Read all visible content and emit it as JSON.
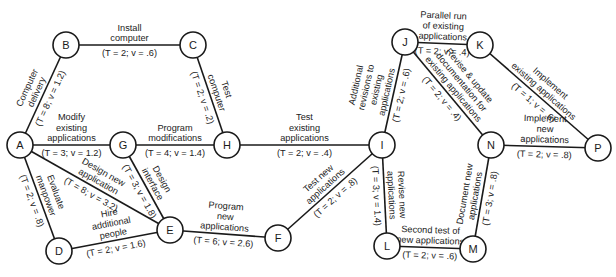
{
  "diagram": {
    "type": "PERT network",
    "nodes": [
      {
        "id": "A",
        "x": 20,
        "y": 145
      },
      {
        "id": "B",
        "x": 66,
        "y": 45
      },
      {
        "id": "C",
        "x": 193,
        "y": 45
      },
      {
        "id": "G",
        "x": 123,
        "y": 145
      },
      {
        "id": "H",
        "x": 227,
        "y": 145
      },
      {
        "id": "I",
        "x": 382,
        "y": 145
      },
      {
        "id": "J",
        "x": 405,
        "y": 42
      },
      {
        "id": "K",
        "x": 480,
        "y": 45
      },
      {
        "id": "N",
        "x": 491,
        "y": 145
      },
      {
        "id": "P",
        "x": 598,
        "y": 148
      },
      {
        "id": "D",
        "x": 59,
        "y": 251
      },
      {
        "id": "E",
        "x": 170,
        "y": 230
      },
      {
        "id": "F",
        "x": 278,
        "y": 238
      },
      {
        "id": "L",
        "x": 387,
        "y": 246
      },
      {
        "id": "M",
        "x": 473,
        "y": 249
      }
    ],
    "edges": [
      {
        "from": "A",
        "to": "B",
        "activity": "Computer delivery",
        "T": "8",
        "v": "1.2",
        "label_lines": [
          "Computer",
          "delivery"
        ],
        "param": "(T = 8; v = 1.2)"
      },
      {
        "from": "B",
        "to": "C",
        "activity": "Install computer",
        "T": "2",
        "v": ".6",
        "label_lines": [
          "Install",
          "computer"
        ],
        "param": "(T = 2; v = .6)"
      },
      {
        "from": "C",
        "to": "H",
        "activity": "Test computer",
        "T": "2",
        "v": ".2",
        "label_lines": [
          "Test",
          "computer"
        ],
        "param": "(T = 2; v = .2)"
      },
      {
        "from": "A",
        "to": "G",
        "activity": "Modify existing applications",
        "T": "3",
        "v": "1.2",
        "label_lines": [
          "Modify",
          "existing",
          "applications"
        ],
        "param": "(T = 3; v = 1.2)"
      },
      {
        "from": "G",
        "to": "H",
        "activity": "Program modifications",
        "T": "4",
        "v": "1.4",
        "label_lines": [
          "Program",
          "modifications"
        ],
        "param": "(T = 4; v = 1.4)"
      },
      {
        "from": "H",
        "to": "I",
        "activity": "Test existing applications",
        "T": "2",
        "v": ".4",
        "label_lines": [
          "Test",
          "existing",
          "applications"
        ],
        "param": "(T = 2; v = .4)"
      },
      {
        "from": "A",
        "to": "D",
        "activity": "Evaluate manpower",
        "T": "2",
        "v": ".8",
        "label_lines": [
          "Evaluate",
          "manpower"
        ],
        "param": "(T = 2; v = .8)"
      },
      {
        "from": "A",
        "to": "E",
        "activity": "Design new application",
        "T": "8",
        "v": "3.2",
        "label_lines": [
          "Design new",
          "application"
        ],
        "param": "(T = 8; v = 3.2)"
      },
      {
        "from": "G",
        "to": "E",
        "activity": "Design interface",
        "T": "3",
        "v": "1.8",
        "label_lines": [
          "Design",
          "interface"
        ],
        "param": "(T = 3; v = 1.8)"
      },
      {
        "from": "D",
        "to": "E",
        "activity": "Hire additional people",
        "T": "2",
        "v": "1.6",
        "label_lines": [
          "Hire",
          "additional",
          "people"
        ],
        "param": "(T = 2; v = 1.6)"
      },
      {
        "from": "E",
        "to": "F",
        "activity": "Program new applications",
        "T": "6",
        "v": "2.6",
        "label_lines": [
          "Program",
          "new",
          "applications"
        ],
        "param": "(T = 6; v = 2.6)"
      },
      {
        "from": "F",
        "to": "I",
        "activity": "Test new applications",
        "T": "2",
        "v": ".8",
        "label_lines": [
          "Test new",
          "applications"
        ],
        "param": "(T = 2; v = .8)"
      },
      {
        "from": "I",
        "to": "J",
        "activity": "Additional revisions to existing applications",
        "T": "2",
        "v": ".6",
        "label_lines": [
          "Additional",
          "revisions to",
          "existing",
          "applications"
        ],
        "param": "(T = 2; v = .6)"
      },
      {
        "from": "J",
        "to": "K",
        "activity": "Parallel run of existing applications",
        "T": "2",
        "v": ".4",
        "label_lines": [
          "Parallel run",
          "of existing",
          "applications"
        ],
        "param": "(T = 2; v = .4)"
      },
      {
        "from": "K",
        "to": "P",
        "activity": "Implement existing applications",
        "T": "1",
        "v": ".6",
        "label_lines": [
          "Implement",
          "existing applications"
        ],
        "param": "(T = 1; v = .6)"
      },
      {
        "from": "J",
        "to": "N",
        "activity": "Revise & update documentation for existing applications",
        "T": "2",
        "v": ".4",
        "label_lines": [
          "Revise & update",
          "documentation for",
          "existing applications"
        ],
        "param": "(T = 2; v = .4)"
      },
      {
        "from": "N",
        "to": "P",
        "activity": "Implement new applications",
        "T": "2",
        "v": ".8",
        "label_lines": [
          "Implement",
          "new",
          "applications"
        ],
        "param": "(T = 2; v = .8)"
      },
      {
        "from": "I",
        "to": "L",
        "activity": "Revise new applications",
        "T": "3",
        "v": "1.4",
        "label_lines": [
          "Revise new",
          "applications"
        ],
        "param": "(T = 3; v = 1.4)"
      },
      {
        "from": "L",
        "to": "M",
        "activity": "Second test of new applications",
        "T": "2",
        "v": ".6",
        "label_lines": [
          "Second test of",
          "new applications"
        ],
        "param": "(T = 2; v = .6)"
      },
      {
        "from": "M",
        "to": "N",
        "activity": "Document new applications",
        "T": "3",
        "v": ".8",
        "label_lines": [
          "Document new",
          "applications"
        ],
        "param": "(T = 3; v = .8)"
      }
    ]
  }
}
